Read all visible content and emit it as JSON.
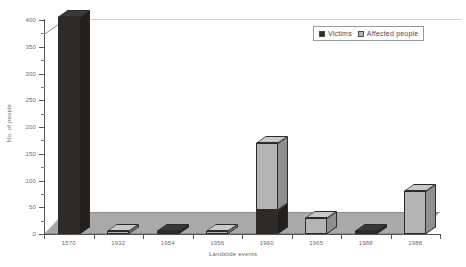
{
  "chart_data": {
    "type": "bar",
    "subtype": "stacked-3d-column",
    "title": "",
    "xlabel": "Landslide events",
    "ylabel": "No. of people",
    "categories": [
      "1570",
      "1932",
      "1954",
      "1956",
      "1960",
      "1965",
      "1988",
      "1988"
    ],
    "series": [
      {
        "name": "Victims",
        "color": "#2e2a28",
        "values": [
          405,
          0,
          5,
          0,
          45,
          0,
          2,
          0
        ]
      },
      {
        "name": "Affected people",
        "color": "#b4b4b4",
        "values": [
          0,
          4,
          0,
          5,
          125,
          30,
          0,
          80
        ]
      }
    ],
    "ylim": [
      0,
      400
    ],
    "ytick_step": 50,
    "yticks": [
      "0",
      "50",
      "100",
      "150",
      "200",
      "250",
      "300",
      "350",
      "400"
    ],
    "grid": false,
    "legend_position": "top-right"
  },
  "legend": {
    "entries": [
      {
        "label": "Victims",
        "color": "#2e2a28"
      },
      {
        "label": "Affected people",
        "color": "#b4b4b4"
      }
    ]
  },
  "axes": {
    "y_title": "No. of people",
    "x_title": "Landslide events"
  }
}
